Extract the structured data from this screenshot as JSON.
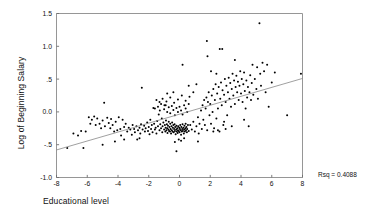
{
  "chart_data": {
    "type": "scatter",
    "title": "",
    "xlabel": "Educational level",
    "ylabel": "Log of Beginning Salary",
    "xlim": [
      -8,
      8
    ],
    "ylim": [
      -1.0,
      1.5
    ],
    "xticks": [
      -8,
      -6,
      -4,
      -2,
      0,
      2,
      4,
      6,
      8
    ],
    "xticklabels": [
      "-8",
      "-6",
      "-4",
      "-2",
      "0",
      "2",
      "4",
      "6",
      "8"
    ],
    "yticks": [
      -1.0,
      -0.5,
      0.0,
      0.5,
      1.0,
      1.5
    ],
    "yticklabels": [
      "-1.0",
      "-.5",
      "0.0",
      ".5",
      "1.0",
      "1.5"
    ],
    "grid": false,
    "legend": null,
    "annotations": [
      {
        "name": "rsq",
        "text": "Rsq = 0.4088",
        "value": 0.4088
      }
    ],
    "fit_line": {
      "type": "linear-regression",
      "x_start": -8.0,
      "y_start": -0.58,
      "x_end": 8.0,
      "y_end": 0.51,
      "slope": 0.0681,
      "intercept": -0.035,
      "color": "#888888"
    },
    "marker": {
      "shape": "circle",
      "color": "#000000",
      "size": 2.0
    },
    "points": [
      [
        -7.3,
        -0.55
      ],
      [
        -6.9,
        -0.33
      ],
      [
        -6.6,
        -0.36
      ],
      [
        -6.4,
        -0.29
      ],
      [
        -6.25,
        -0.55
      ],
      [
        -6.1,
        -0.3
      ],
      [
        -5.9,
        -0.08
      ],
      [
        -5.8,
        -0.18
      ],
      [
        -5.7,
        -0.12
      ],
      [
        -5.55,
        -0.07
      ],
      [
        -5.45,
        -0.2
      ],
      [
        -5.35,
        -0.1
      ],
      [
        -5.2,
        -0.18
      ],
      [
        -5.1,
        -0.25
      ],
      [
        -5.0,
        -0.13
      ],
      [
        -4.9,
        0.14
      ],
      [
        -4.85,
        -0.22
      ],
      [
        -4.7,
        -0.09
      ],
      [
        -4.6,
        -0.17
      ],
      [
        -4.5,
        -0.25
      ],
      [
        -4.45,
        -0.11
      ],
      [
        -4.35,
        -0.2
      ],
      [
        -4.25,
        -0.3
      ],
      [
        -4.15,
        -0.15
      ],
      [
        -4.05,
        -0.28
      ],
      [
        -3.95,
        -0.08
      ],
      [
        -3.85,
        -0.26
      ],
      [
        -3.8,
        -0.36
      ],
      [
        -3.7,
        -0.12
      ],
      [
        -3.6,
        -0.23
      ],
      [
        -3.5,
        -0.18
      ],
      [
        -3.4,
        -0.3
      ],
      [
        -3.3,
        -0.24
      ],
      [
        -3.2,
        -0.27
      ],
      [
        -3.1,
        -0.35
      ],
      [
        -3.05,
        -0.2
      ],
      [
        -2.95,
        -0.26
      ],
      [
        -2.9,
        -0.31
      ],
      [
        -2.8,
        -0.22
      ],
      [
        -2.75,
        -0.42
      ],
      [
        -2.7,
        -0.28
      ],
      [
        -2.6,
        -0.24
      ],
      [
        -2.55,
        -0.33
      ],
      [
        -2.5,
        -0.19
      ],
      [
        -2.45,
        0.37
      ],
      [
        -2.4,
        -0.27
      ],
      [
        -2.3,
        -0.21
      ],
      [
        -2.25,
        -0.3
      ],
      [
        -2.2,
        -0.25
      ],
      [
        -2.1,
        -0.16
      ],
      [
        -2.05,
        -0.29
      ],
      [
        -2.0,
        -0.23
      ],
      [
        -1.95,
        -0.34
      ],
      [
        -1.9,
        -0.12
      ],
      [
        -1.85,
        -0.26
      ],
      [
        -1.8,
        -0.2
      ],
      [
        -1.75,
        -0.31
      ],
      [
        -1.7,
        0.06
      ],
      [
        -1.65,
        -0.18
      ],
      [
        -1.6,
        -0.27
      ],
      [
        -1.55,
        -0.24
      ],
      [
        -1.5,
        -0.33
      ],
      [
        -1.45,
        -0.14
      ],
      [
        -1.4,
        -0.22
      ],
      [
        -1.35,
        -0.04
      ],
      [
        -1.3,
        -0.28
      ],
      [
        -1.28,
        0.02
      ],
      [
        -1.25,
        -0.19
      ],
      [
        -1.2,
        -0.25
      ],
      [
        -1.15,
        -0.1
      ],
      [
        -1.12,
        -0.31
      ],
      [
        -1.1,
        -0.22
      ],
      [
        -1.05,
        -0.16
      ],
      [
        -1.0,
        -0.27
      ],
      [
        -0.98,
        0.1
      ],
      [
        -0.95,
        -0.2
      ],
      [
        -0.92,
        -0.3
      ],
      [
        -0.9,
        -0.24
      ],
      [
        -0.88,
        -0.13
      ],
      [
        -0.85,
        -0.28
      ],
      [
        -0.82,
        -0.19
      ],
      [
        -0.8,
        -0.25
      ],
      [
        -0.78,
        -0.32
      ],
      [
        -0.75,
        -0.21
      ],
      [
        -0.72,
        -0.27
      ],
      [
        -0.7,
        -0.15
      ],
      [
        -0.68,
        -0.29
      ],
      [
        -0.65,
        -0.23
      ],
      [
        -0.62,
        -0.3
      ],
      [
        -0.6,
        -0.18
      ],
      [
        -0.58,
        -0.26
      ],
      [
        -0.55,
        -0.33
      ],
      [
        -0.52,
        -0.22
      ],
      [
        -0.5,
        -0.28
      ],
      [
        -0.48,
        -0.16
      ],
      [
        -0.45,
        -0.3
      ],
      [
        -0.43,
        -0.24
      ],
      [
        -0.4,
        -0.2
      ],
      [
        -0.38,
        -0.31
      ],
      [
        -0.35,
        -0.26
      ],
      [
        -0.32,
        -0.19
      ],
      [
        -0.3,
        -0.29
      ],
      [
        -0.28,
        -0.23
      ],
      [
        -0.25,
        -0.34
      ],
      [
        -0.22,
        -0.27
      ],
      [
        -0.2,
        -0.21
      ],
      [
        -0.18,
        -0.3
      ],
      [
        -0.15,
        -0.25
      ],
      [
        -0.12,
        -0.32
      ],
      [
        -0.1,
        -0.28
      ],
      [
        -0.08,
        -0.22
      ],
      [
        -0.05,
        -0.29
      ],
      [
        -0.02,
        -0.24
      ],
      [
        0.0,
        -0.31
      ],
      [
        0.03,
        -0.26
      ],
      [
        0.05,
        -0.2
      ],
      [
        0.08,
        -0.28
      ],
      [
        0.1,
        -0.35
      ],
      [
        0.12,
        -0.23
      ],
      [
        0.15,
        -0.3
      ],
      [
        0.18,
        -0.26
      ],
      [
        0.2,
        -0.19
      ],
      [
        0.22,
        -0.29
      ],
      [
        0.25,
        -0.24
      ],
      [
        0.28,
        -0.33
      ],
      [
        0.3,
        -0.27
      ],
      [
        0.32,
        -0.21
      ],
      [
        0.35,
        -0.3
      ],
      [
        0.38,
        -0.25
      ],
      [
        0.4,
        -0.18
      ],
      [
        0.42,
        -0.28
      ],
      [
        0.45,
        -0.23
      ],
      [
        0.48,
        -0.31
      ],
      [
        0.5,
        -0.26
      ],
      [
        0.55,
        -0.2
      ],
      [
        0.6,
        -0.29
      ],
      [
        -1.6,
        0.05
      ],
      [
        -1.4,
        0.08
      ],
      [
        -1.2,
        0.12
      ],
      [
        -1.0,
        0.04
      ],
      [
        -0.9,
        0.1
      ],
      [
        -0.8,
        0.0
      ],
      [
        -0.7,
        0.07
      ],
      [
        -0.6,
        -0.02
      ],
      [
        -0.5,
        0.09
      ],
      [
        -0.4,
        0.03
      ],
      [
        -0.3,
        -0.05
      ],
      [
        -0.2,
        0.06
      ],
      [
        -0.1,
        0.0
      ],
      [
        0.0,
        0.08
      ],
      [
        0.1,
        0.02
      ],
      [
        0.2,
        -0.04
      ],
      [
        0.3,
        0.1
      ],
      [
        0.4,
        0.05
      ],
      [
        0.5,
        0.0
      ],
      [
        0.6,
        0.12
      ],
      [
        -1.5,
        0.18
      ],
      [
        -1.3,
        0.15
      ],
      [
        -1.1,
        0.2
      ],
      [
        -0.85,
        0.16
      ],
      [
        -0.6,
        0.22
      ],
      [
        -0.35,
        0.14
      ],
      [
        -0.1,
        0.19
      ],
      [
        0.15,
        0.25
      ],
      [
        0.4,
        0.17
      ],
      [
        0.65,
        0.23
      ],
      [
        0.2,
        0.72
      ],
      [
        -0.2,
        -0.6
      ],
      [
        -0.3,
        -0.46
      ],
      [
        0.1,
        -0.44
      ],
      [
        0.3,
        -0.4
      ],
      [
        -0.05,
        -0.42
      ],
      [
        0.7,
        -0.2
      ],
      [
        0.8,
        -0.27
      ],
      [
        0.9,
        -0.15
      ],
      [
        1.0,
        -0.3
      ],
      [
        1.1,
        -0.22
      ],
      [
        1.2,
        -0.08
      ],
      [
        1.25,
        -0.33
      ],
      [
        1.3,
        -0.18
      ],
      [
        1.4,
        0.02
      ],
      [
        1.45,
        -0.26
      ],
      [
        1.5,
        0.1
      ],
      [
        1.55,
        -0.12
      ],
      [
        1.6,
        0.18
      ],
      [
        1.65,
        -0.2
      ],
      [
        1.7,
        0.05
      ],
      [
        1.75,
        0.22
      ],
      [
        1.8,
        -0.28
      ],
      [
        1.85,
        0.15
      ],
      [
        1.9,
        0.3
      ],
      [
        1.95,
        -0.05
      ],
      [
        1.82,
        0.85
      ],
      [
        1.78,
        1.08
      ],
      [
        2.0,
        0.12
      ],
      [
        2.05,
        -0.18
      ],
      [
        2.1,
        0.25
      ],
      [
        2.15,
        0.0
      ],
      [
        2.2,
        0.35
      ],
      [
        2.25,
        -0.25
      ],
      [
        2.3,
        0.18
      ],
      [
        2.35,
        0.42
      ],
      [
        2.4,
        -0.1
      ],
      [
        2.45,
        0.28
      ],
      [
        2.5,
        0.05
      ],
      [
        2.55,
        0.38
      ],
      [
        2.6,
        -0.3
      ],
      [
        2.65,
        0.2
      ],
      [
        2.7,
        0.45
      ],
      [
        2.75,
        0.1
      ],
      [
        2.8,
        0.33
      ],
      [
        2.85,
        -0.2
      ],
      [
        2.9,
        0.26
      ],
      [
        2.95,
        0.5
      ],
      [
        2.62,
        0.96
      ],
      [
        2.78,
        0.96
      ],
      [
        3.0,
        0.15
      ],
      [
        3.05,
        0.4
      ],
      [
        3.1,
        -0.05
      ],
      [
        3.15,
        0.3
      ],
      [
        3.2,
        0.52
      ],
      [
        3.25,
        0.2
      ],
      [
        3.3,
        0.44
      ],
      [
        3.35,
        0.08
      ],
      [
        3.4,
        0.35
      ],
      [
        3.45,
        0.58
      ],
      [
        3.5,
        0.25
      ],
      [
        3.55,
        0.48
      ],
      [
        3.6,
        0.12
      ],
      [
        3.65,
        0.38
      ],
      [
        3.7,
        0.55
      ],
      [
        3.75,
        0.3
      ],
      [
        3.8,
        0.46
      ],
      [
        3.85,
        0.18
      ],
      [
        3.9,
        0.4
      ],
      [
        3.95,
        0.62
      ],
      [
        3.6,
        0.79
      ],
      [
        4.0,
        0.28
      ],
      [
        4.05,
        0.5
      ],
      [
        4.1,
        0.15
      ],
      [
        4.15,
        0.42
      ],
      [
        4.2,
        0.6
      ],
      [
        4.25,
        0.32
      ],
      [
        4.3,
        0.05
      ],
      [
        4.35,
        0.48
      ],
      [
        4.4,
        0.22
      ],
      [
        4.45,
        0.38
      ],
      [
        4.5,
        -0.22
      ],
      [
        4.55,
        0.3
      ],
      [
        4.6,
        0.56
      ],
      [
        4.65,
        0.18
      ],
      [
        4.7,
        0.44
      ],
      [
        4.75,
        0.72
      ],
      [
        4.8,
        0.26
      ],
      [
        4.9,
        0.5
      ],
      [
        5.0,
        0.35
      ],
      [
        5.05,
        0.68
      ],
      [
        5.1,
        0.2
      ],
      [
        5.2,
        1.35
      ],
      [
        5.25,
        0.58
      ],
      [
        5.3,
        0.4
      ],
      [
        5.4,
        0.75
      ],
      [
        5.5,
        0.62
      ],
      [
        5.6,
        0.3
      ],
      [
        5.7,
        0.72
      ],
      [
        5.8,
        0.08
      ],
      [
        6.0,
        0.45
      ],
      [
        6.2,
        0.6
      ],
      [
        2.5,
        -0.28
      ],
      [
        3.0,
        -0.26
      ],
      [
        3.4,
        -0.22
      ],
      [
        2.2,
        -0.3
      ],
      [
        1.2,
        -0.45
      ],
      [
        2.9,
        -0.15
      ],
      [
        4.2,
        -0.12
      ],
      [
        7.0,
        -0.05
      ],
      [
        7.9,
        0.58
      ],
      [
        -2.6,
        -0.4
      ],
      [
        -3.6,
        -0.42
      ],
      [
        -4.2,
        -0.45
      ],
      [
        -5.0,
        -0.5
      ],
      [
        -0.4,
        0.3
      ],
      [
        0.9,
        0.3
      ],
      [
        1.1,
        0.42
      ],
      [
        0.6,
        0.4
      ],
      [
        -0.8,
        0.28
      ],
      [
        2.05,
        0.62
      ],
      [
        2.4,
        0.58
      ]
    ]
  },
  "axes": {
    "frame_color": "#8a8a8a",
    "tick_color": "#6f6f6f",
    "text_color": "#111111"
  }
}
